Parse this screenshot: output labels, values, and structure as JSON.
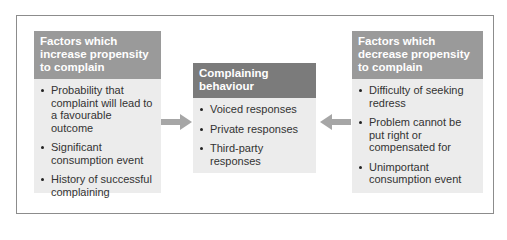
{
  "diagram": {
    "left": {
      "title": "Factors which increase propensity to complain",
      "items": [
        "Probability that complaint will lead to a favourable outcome",
        "Significant consumption event",
        "History of successful complaining"
      ]
    },
    "middle": {
      "title": "Complaining behaviour",
      "items": [
        "Voiced responses",
        "Private responses",
        "Third-party responses"
      ]
    },
    "right": {
      "title": "Factors which decrease propensity to complain",
      "items": [
        "Difficulty of seeking redress",
        "Problem cannot be put right or compensated for",
        "Unimportant consumption event"
      ]
    },
    "arrows": [
      {
        "from": "left",
        "to": "middle",
        "direction": "right"
      },
      {
        "from": "right",
        "to": "middle",
        "direction": "left"
      }
    ],
    "colors": {
      "side_header": "#9a9a9a",
      "middle_header": "#7b7b7b",
      "box_body": "#ececec",
      "arrow": "#a6a6a6"
    }
  }
}
